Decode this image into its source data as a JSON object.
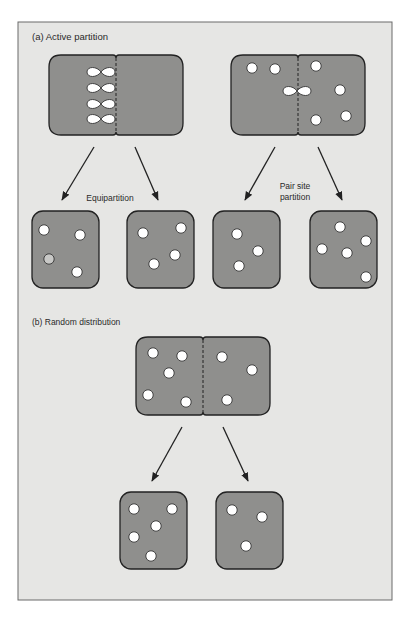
{
  "figure": {
    "background": "#e6e6e4",
    "frame_color": "#6a6a6a",
    "cell_fill": "#8f8f8d",
    "cell_stroke": "#222222",
    "dot_fill": "#ffffff"
  },
  "section_a": {
    "title": "(a)  Active partition",
    "left_caption": "Equipartition",
    "right_caption_line1": "Pair site",
    "right_caption_line2": "partition"
  },
  "section_b": {
    "title": "(b) Random distribution"
  },
  "diagram": {
    "parent_cells": [
      {
        "id": "a-equipartition-parent",
        "x": 49,
        "y": 55,
        "w": 134,
        "h": 80,
        "paired_dots": [
          [
            101,
            72
          ],
          [
            101,
            88
          ],
          [
            101,
            104
          ],
          [
            101,
            119
          ]
        ],
        "dots": []
      },
      {
        "id": "a-pairsite-parent",
        "x": 231,
        "y": 55,
        "w": 134,
        "h": 80,
        "paired_dots": [
          [
            297,
            91
          ]
        ],
        "dots": [
          [
            252,
            68
          ],
          [
            275,
            69
          ],
          [
            316,
            66
          ],
          [
            340,
            90
          ],
          [
            316,
            120
          ],
          [
            346,
            116
          ]
        ]
      },
      {
        "id": "b-random-parent",
        "x": 136,
        "y": 337,
        "w": 134,
        "h": 78,
        "paired_dots": [],
        "dots": [
          [
            153,
            353
          ],
          [
            182,
            356
          ],
          [
            169,
            373
          ],
          [
            148,
            395
          ],
          [
            186,
            402
          ],
          [
            222,
            357
          ],
          [
            252,
            370
          ],
          [
            227,
            400
          ]
        ]
      }
    ],
    "daughter_cells": [
      {
        "id": "a-equi-daughter-left",
        "x": 32,
        "y": 211,
        "w": 67,
        "h": 77,
        "dots": [
          [
            44,
            230
          ],
          [
            80,
            235
          ],
          [
            49,
            259,
            "grey"
          ],
          [
            77,
            272
          ]
        ]
      },
      {
        "id": "a-equi-daughter-right",
        "x": 127,
        "y": 211,
        "w": 67,
        "h": 77,
        "dots": [
          [
            143,
            233
          ],
          [
            181,
            228
          ],
          [
            175,
            255
          ],
          [
            154,
            264
          ]
        ]
      },
      {
        "id": "a-pair-daughter-left",
        "x": 213,
        "y": 211,
        "w": 67,
        "h": 77,
        "dots": [
          [
            237,
            234
          ],
          [
            258,
            251
          ],
          [
            239,
            266
          ]
        ]
      },
      {
        "id": "a-pair-daughter-right",
        "x": 310,
        "y": 211,
        "w": 67,
        "h": 77,
        "dots": [
          [
            340,
            227
          ],
          [
            366,
            241
          ],
          [
            322,
            249
          ],
          [
            347,
            253
          ],
          [
            366,
            277
          ]
        ]
      }
    ],
    "random_daughters": [
      {
        "id": "b-daughter-left",
        "x": 120,
        "y": 492,
        "w": 67,
        "h": 77,
        "dots": [
          [
            134,
            509
          ],
          [
            172,
            509
          ],
          [
            156,
            526
          ],
          [
            134,
            537
          ],
          [
            151,
            556
          ]
        ]
      },
      {
        "id": "b-daughter-right",
        "x": 216,
        "y": 492,
        "w": 67,
        "h": 77,
        "dots": [
          [
            232,
            510
          ],
          [
            262,
            517
          ],
          [
            246,
            546
          ]
        ]
      }
    ],
    "arrows": [
      {
        "x1": 94,
        "y1": 147,
        "x2": 62,
        "y2": 200
      },
      {
        "x1": 135,
        "y1": 147,
        "x2": 158,
        "y2": 200
      },
      {
        "x1": 275,
        "y1": 147,
        "x2": 245,
        "y2": 200
      },
      {
        "x1": 318,
        "y1": 147,
        "x2": 342,
        "y2": 200
      },
      {
        "x1": 182,
        "y1": 427,
        "x2": 152,
        "y2": 481
      },
      {
        "x1": 223,
        "y1": 427,
        "x2": 248,
        "y2": 481
      }
    ]
  }
}
